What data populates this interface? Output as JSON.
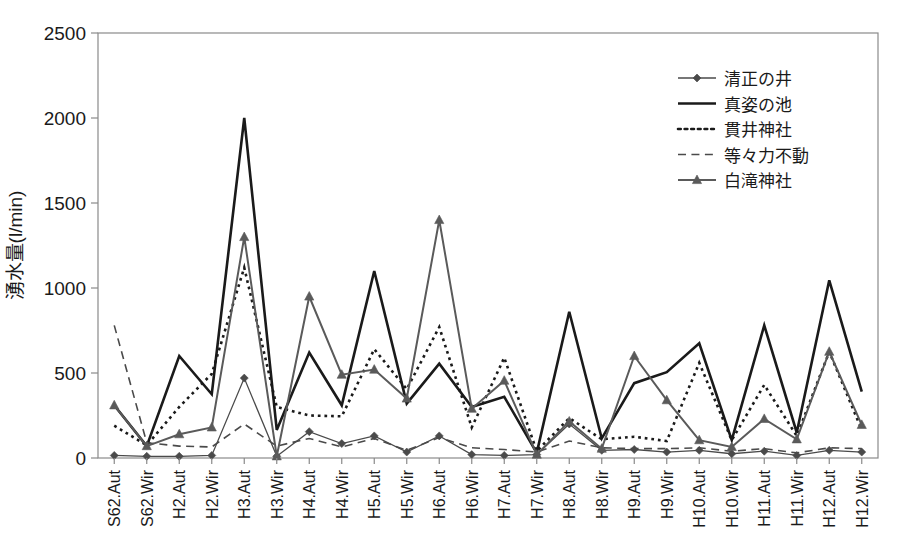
{
  "chart_data": {
    "type": "line",
    "title": "",
    "xlabel": "",
    "ylabel": "湧水量(l/min)",
    "ylim": [
      0,
      2500
    ],
    "yticks": [
      0,
      500,
      1000,
      1500,
      2000,
      2500
    ],
    "grid": false,
    "legend_position": "top-right",
    "categories": [
      "S62.Aut",
      "S62.Wir",
      "H2.Aut",
      "H2.Wir",
      "H3.Aut",
      "H3.Wir",
      "H4.Aut",
      "H4.Wir",
      "H5.Aut",
      "H5.Wir",
      "H6.Aut",
      "H6.Wir",
      "H7.Aut",
      "H7.Wir",
      "H8.Aut",
      "H8.Wir",
      "H9.Aut",
      "H9.Wir",
      "H10.Aut",
      "H10.Wir",
      "H11.Aut",
      "H11.Wir",
      "H12.Aut",
      "H12.Wir"
    ],
    "series": [
      {
        "name": "清正の井",
        "style": "solid-marker-diamond",
        "color": "#4a4a4a",
        "width": 1.3,
        "marker": "diamond",
        "values": [
          15,
          10,
          10,
          15,
          470,
          10,
          155,
          85,
          130,
          35,
          130,
          20,
          15,
          20,
          200,
          45,
          50,
          35,
          45,
          25,
          40,
          15,
          45,
          35
        ]
      },
      {
        "name": "真姿の池",
        "style": "solid",
        "color": "#1a1a1a",
        "width": 2.6,
        "marker": "none",
        "values": [
          310,
          70,
          600,
          375,
          2000,
          165,
          620,
          310,
          1100,
          320,
          555,
          300,
          360,
          30,
          860,
          115,
          440,
          505,
          675,
          105,
          780,
          150,
          1045,
          390
        ]
      },
      {
        "name": "貫井神社",
        "style": "dotted",
        "color": "#1a1a1a",
        "width": 2.6,
        "marker": "none",
        "values": [
          190,
          75,
          300,
          495,
          1120,
          300,
          250,
          245,
          640,
          405,
          770,
          180,
          590,
          40,
          235,
          110,
          125,
          100,
          560,
          105,
          430,
          130,
          625,
          165
        ]
      },
      {
        "name": "等々力不動",
        "style": "dashed",
        "color": "#4a4a4a",
        "width": 1.6,
        "marker": "none",
        "values": [
          780,
          90,
          70,
          65,
          200,
          70,
          115,
          65,
          115,
          45,
          120,
          60,
          50,
          35,
          100,
          60,
          55,
          55,
          60,
          40,
          55,
          30,
          60,
          55
        ]
      },
      {
        "name": "白滝神社",
        "style": "solid-marker-triangle",
        "color": "#5a5a5a",
        "width": 2.0,
        "marker": "triangle",
        "values": [
          310,
          70,
          140,
          180,
          1300,
          10,
          950,
          490,
          520,
          350,
          1400,
          290,
          455,
          20,
          215,
          55,
          600,
          340,
          105,
          65,
          230,
          110,
          625,
          195
        ]
      }
    ]
  },
  "axes": {
    "y_tick_labels": [
      "0",
      "500",
      "1000",
      "1500",
      "2000",
      "2500"
    ],
    "y_axis_title": "湧水量(l/min)"
  },
  "legend": {
    "entries": [
      {
        "label": "清正の井"
      },
      {
        "label": "真姿の池"
      },
      {
        "label": "貫井神社"
      },
      {
        "label": "等々力不動"
      },
      {
        "label": "白滝神社"
      }
    ]
  }
}
